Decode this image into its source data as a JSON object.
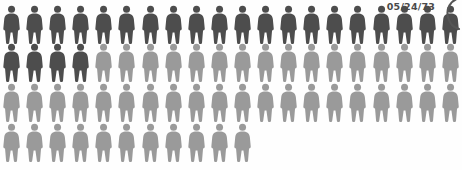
{
  "meta": {
    "date_label": "05/24/73",
    "icon_names": {
      "person": "person-icon",
      "arc": "crescent-arc-icon"
    }
  },
  "colors": {
    "background": "#fefefe",
    "dark_figure": "#4d4d4d",
    "light_figure": "#9a9a9a",
    "date_text": "#4a4a4a",
    "arc_stroke": "#555555"
  },
  "chart_data": {
    "type": "pictogram",
    "title": "",
    "subtitle": "",
    "xlabel": "",
    "ylabel": "",
    "unit_label": "person",
    "icons_per_row": 20,
    "total_icons": 71,
    "legend": [
      {
        "name": "Highlighted",
        "color": "#4d4d4d",
        "count": 24
      },
      {
        "name": "Remainder",
        "color": "#9a9a9a",
        "count": 47
      }
    ],
    "series": [
      {
        "name": "Highlighted",
        "values": [
          20,
          4,
          0,
          0
        ]
      },
      {
        "name": "Remainder",
        "values": [
          0,
          16,
          20,
          11
        ]
      }
    ],
    "categories": [
      "Row 1",
      "Row 2",
      "Row 3",
      "Row 4"
    ],
    "rows": [
      {
        "row": 1,
        "top": 4,
        "count": 20,
        "dark_count": 20,
        "light_count": 0
      },
      {
        "row": 2,
        "top": 42,
        "count": 20,
        "dark_count": 4,
        "light_count": 16
      },
      {
        "row": 3,
        "top": 82,
        "count": 20,
        "dark_count": 0,
        "light_count": 20
      },
      {
        "row": 4,
        "top": 122,
        "count": 11,
        "dark_count": 0,
        "light_count": 11
      }
    ],
    "annotations": [
      {
        "name": "date-label",
        "text": "05/24/73",
        "position": "top-right"
      }
    ],
    "grid": false,
    "legend_position": "none"
  }
}
